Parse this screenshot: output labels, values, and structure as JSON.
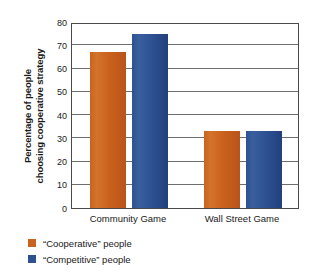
{
  "chart_data": {
    "type": "bar",
    "title": "",
    "subtitle": "",
    "xlabel": "",
    "ylabel_line1": "Percentage of people",
    "ylabel_line2": "choosing cooperative strategy",
    "categories": [
      "Community Game",
      "Wall Street Game"
    ],
    "series": [
      {
        "name": "“Cooperative” people",
        "color": "#c8641f",
        "values": [
          67,
          33
        ]
      },
      {
        "name": "“Competitive” people",
        "color": "#2e5190",
        "values": [
          75,
          33
        ]
      }
    ],
    "ylim": [
      0,
      80
    ],
    "ytick_step": 10,
    "yticks": [
      80,
      70,
      60,
      50,
      40,
      30,
      20,
      10,
      0
    ],
    "grid": true,
    "grid_axis": "y",
    "legend_position": "below-left",
    "background_color": "#ffffff",
    "axis_color": "#4a4a4a"
  }
}
